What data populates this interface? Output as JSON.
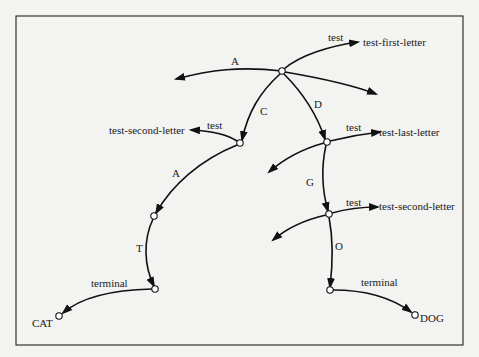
{
  "diagram": {
    "type": "discrimination-net",
    "nodes": [
      {
        "id": "root",
        "x": 282,
        "y": 71
      },
      {
        "id": "n_c",
        "x": 240,
        "y": 143
      },
      {
        "id": "n_d",
        "x": 327,
        "y": 142
      },
      {
        "id": "n_ca",
        "x": 154,
        "y": 216
      },
      {
        "id": "n_dg",
        "x": 329,
        "y": 214
      },
      {
        "id": "n_cat",
        "x": 155,
        "y": 289
      },
      {
        "id": "n_dog",
        "x": 330,
        "y": 290
      },
      {
        "id": "leaf_cat",
        "x": 59,
        "y": 316
      },
      {
        "id": "leaf_dog",
        "x": 415,
        "y": 315
      }
    ],
    "edge_labels": {
      "root_left": "A",
      "root_c": "C",
      "root_d": "D",
      "c_a": "A",
      "d_g": "G",
      "ca_t": "T",
      "dg_o": "O"
    },
    "test_labels": {
      "root_test": "test",
      "root_test_target": "test-first-letter",
      "c_test": "test",
      "c_test_target": "test-second-letter",
      "d_test": "test",
      "d_test_target": "test-last-letter",
      "dg_test": "test",
      "dg_test_target": "test-second-letter"
    },
    "terminal_labels": {
      "cat_terminal": "terminal",
      "dog_terminal": "terminal"
    },
    "leaf_labels": {
      "cat": "CAT",
      "dog": "DOG"
    }
  }
}
